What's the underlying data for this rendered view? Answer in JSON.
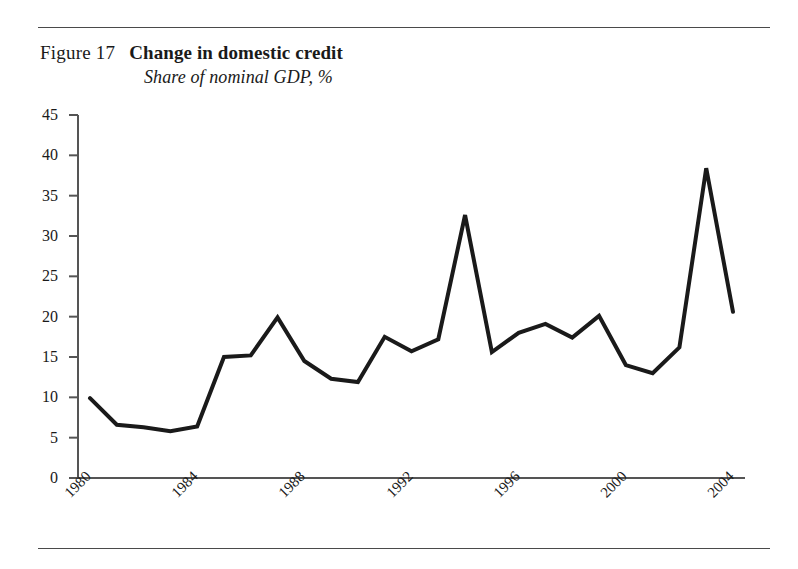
{
  "figure": {
    "number_label": "Figure 17",
    "title": "Change in domestic credit",
    "subtitle": "Share of nominal GDP, %"
  },
  "chart_data": {
    "type": "line",
    "title": "Change in domestic credit",
    "subtitle": "Share of nominal GDP, %",
    "xlabel": "",
    "ylabel": "",
    "x": [
      1980,
      1981,
      1982,
      1983,
      1984,
      1985,
      1986,
      1987,
      1988,
      1989,
      1990,
      1991,
      1992,
      1993,
      1994,
      1995,
      1996,
      1997,
      1998,
      1999,
      2000,
      2001,
      2002,
      2003,
      2004
    ],
    "values": [
      9.9,
      6.6,
      6.3,
      5.8,
      6.4,
      15.0,
      15.2,
      19.9,
      14.5,
      12.3,
      11.9,
      17.5,
      15.7,
      17.2,
      32.6,
      15.6,
      18.0,
      19.1,
      17.4,
      20.1,
      14.0,
      13.0,
      16.2,
      38.4,
      20.6
    ],
    "series": [
      {
        "name": "Change in domestic credit",
        "values": [
          9.9,
          6.6,
          6.3,
          5.8,
          6.4,
          15.0,
          15.2,
          19.9,
          14.5,
          12.3,
          11.9,
          17.5,
          15.7,
          17.2,
          32.6,
          15.6,
          18.0,
          19.1,
          17.4,
          20.1,
          14.0,
          13.0,
          16.2,
          38.4,
          20.6
        ],
        "color": "#1a1a1a"
      }
    ],
    "ylim": [
      0,
      45
    ],
    "xlim": [
      1980,
      2004
    ],
    "yticks": [
      0,
      5,
      10,
      15,
      20,
      25,
      30,
      35,
      40,
      45
    ],
    "ytick_labels": [
      "0",
      "5",
      "10",
      "15",
      "20",
      "25",
      "30",
      "35",
      "40",
      "45"
    ],
    "xticks": [
      1980,
      1984,
      1988,
      1992,
      1996,
      2000,
      2004
    ],
    "xtick_labels": [
      "1980",
      "1984",
      "1988",
      "1992",
      "1996",
      "2000",
      "2004"
    ],
    "xtick_rotation": -45,
    "grid": false,
    "legend": false,
    "line_color": "#1a1a1a",
    "line_width": 4,
    "axis_color": "#555555"
  }
}
